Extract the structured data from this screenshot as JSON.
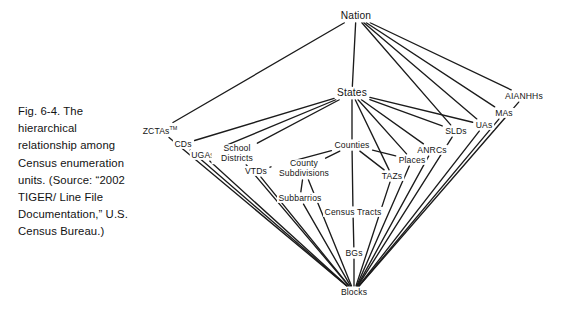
{
  "caption": {
    "text": "Fig. 6-4. The hierarchical relationship among Census enumeration units. (Source: “2002 TIGER/ Line File Documentation,” U.S. Census Bureau.)"
  },
  "diagram": {
    "title": "Hierarchical relationship among Census enumeration units",
    "line_color": "#1b1b1b",
    "text_color": "#151515",
    "background": "#ffffff",
    "nodes": [
      {
        "id": "nation",
        "label": "Nation",
        "x": 356,
        "y": 16,
        "size": "big"
      },
      {
        "id": "states",
        "label": "States",
        "x": 352,
        "y": 93,
        "size": "big"
      },
      {
        "id": "zctas",
        "label": "ZCTAs",
        "sup": "TM",
        "x": 160,
        "y": 130,
        "size": "normal"
      },
      {
        "id": "cds",
        "label": "CDs",
        "x": 183,
        "y": 144,
        "size": "normal"
      },
      {
        "id": "ugas",
        "label": "UGAs",
        "x": 203,
        "y": 155,
        "size": "normal"
      },
      {
        "id": "school-districts",
        "label": "School Districts",
        "x": 237,
        "y": 154,
        "size": "normal",
        "multiline": true,
        "width": 48
      },
      {
        "id": "vtds",
        "label": "VTDs",
        "x": 256,
        "y": 171,
        "size": "normal"
      },
      {
        "id": "county-subdivisions",
        "label": "County Subdivisions",
        "x": 304,
        "y": 169,
        "size": "normal",
        "multiline": true,
        "width": 62
      },
      {
        "id": "subbarrios",
        "label": "Subbarrios",
        "x": 300,
        "y": 198,
        "size": "normal"
      },
      {
        "id": "counties",
        "label": "Counties",
        "x": 352,
        "y": 145,
        "size": "normal"
      },
      {
        "id": "census-tracts",
        "label": "Census Tracts",
        "x": 353,
        "y": 212,
        "size": "normal"
      },
      {
        "id": "bgs",
        "label": "BGs",
        "x": 354,
        "y": 253,
        "size": "normal"
      },
      {
        "id": "blocks",
        "label": "Blocks",
        "x": 354,
        "y": 292,
        "size": "normal"
      },
      {
        "id": "tazs",
        "label": "TAZs",
        "x": 392,
        "y": 176,
        "size": "normal"
      },
      {
        "id": "places",
        "label": "Places",
        "x": 412,
        "y": 160,
        "size": "normal"
      },
      {
        "id": "anrcs",
        "label": "ANRCs",
        "x": 432,
        "y": 150,
        "size": "normal"
      },
      {
        "id": "slds",
        "label": "SLDs",
        "x": 456,
        "y": 131,
        "size": "normal"
      },
      {
        "id": "uas",
        "label": "UAs",
        "x": 484,
        "y": 125,
        "size": "normal"
      },
      {
        "id": "mas",
        "label": "MAs",
        "x": 504,
        "y": 113,
        "size": "normal"
      },
      {
        "id": "aianhhs",
        "label": "AIANHHs",
        "x": 524,
        "y": 96,
        "size": "normal"
      }
    ],
    "edges": [
      {
        "from": "nation",
        "to": "zctas"
      },
      {
        "from": "nation",
        "to": "states"
      },
      {
        "from": "nation",
        "to": "slds"
      },
      {
        "from": "nation",
        "to": "uas"
      },
      {
        "from": "nation",
        "to": "mas"
      },
      {
        "from": "nation",
        "to": "aianhhs"
      },
      {
        "from": "states",
        "to": "cds"
      },
      {
        "from": "states",
        "to": "ugas"
      },
      {
        "from": "states",
        "to": "school-districts"
      },
      {
        "from": "states",
        "to": "counties"
      },
      {
        "from": "states",
        "to": "places"
      },
      {
        "from": "states",
        "to": "tazs"
      },
      {
        "from": "states",
        "to": "anrcs"
      },
      {
        "from": "states",
        "to": "slds"
      },
      {
        "from": "states",
        "to": "uas"
      },
      {
        "from": "counties",
        "to": "vtds"
      },
      {
        "from": "counties",
        "to": "county-subdivisions"
      },
      {
        "from": "counties",
        "to": "census-tracts"
      },
      {
        "from": "counties",
        "to": "places"
      },
      {
        "from": "counties",
        "to": "tazs"
      },
      {
        "from": "county-subdivisions",
        "to": "subbarrios"
      },
      {
        "from": "census-tracts",
        "to": "bgs"
      },
      {
        "from": "bgs",
        "to": "blocks"
      },
      {
        "from": "zctas",
        "to": "blocks"
      },
      {
        "from": "cds",
        "to": "blocks"
      },
      {
        "from": "ugas",
        "to": "blocks"
      },
      {
        "from": "school-districts",
        "to": "blocks"
      },
      {
        "from": "vtds",
        "to": "blocks"
      },
      {
        "from": "county-subdivisions",
        "to": "blocks"
      },
      {
        "from": "subbarrios",
        "to": "blocks"
      },
      {
        "from": "tazs",
        "to": "blocks"
      },
      {
        "from": "places",
        "to": "blocks"
      },
      {
        "from": "anrcs",
        "to": "blocks"
      },
      {
        "from": "slds",
        "to": "blocks"
      },
      {
        "from": "uas",
        "to": "blocks"
      },
      {
        "from": "mas",
        "to": "blocks"
      },
      {
        "from": "aianhhs",
        "to": "blocks"
      }
    ]
  }
}
